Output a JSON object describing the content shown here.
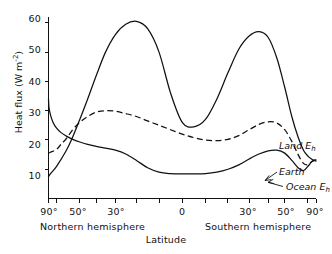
{
  "chart_data": {
    "type": "line",
    "title": "",
    "xlabel": "Latitude",
    "ylabel": "Heat flux (W m-2)",
    "ylabel_main": "Heat flux (W m",
    "ylabel_exp": "-2",
    "ylabel_close": ")",
    "xlim_note": "sine-latitude scale, 90 deg N (left) to 90 deg S (right)",
    "ylim": [
      0,
      62
    ],
    "grid": false,
    "legend_position": "inline-annotations-right",
    "yticks": [
      10,
      20,
      30,
      40,
      50,
      60
    ],
    "ytick_labels": [
      "10",
      "20",
      "30",
      "40",
      "50",
      "60"
    ],
    "xticks_deg": [
      90,
      70,
      50,
      40,
      30,
      20,
      10,
      0,
      -10,
      -20,
      -30,
      -40,
      -50,
      -70,
      -90
    ],
    "xtick_labels": [
      {
        "text": "90°",
        "deg": 90
      },
      {
        "text": "50°",
        "deg": 50
      },
      {
        "text": "30°",
        "deg": 30
      },
      {
        "text": "0",
        "deg": 0
      },
      {
        "text": "30°",
        "deg": -30
      },
      {
        "text": "50°",
        "deg": -50
      },
      {
        "text": "90°",
        "deg": -90
      }
    ],
    "hemisphere_labels": [
      {
        "text": "Northern hemisphere",
        "side": "north"
      },
      {
        "text": "Southern hemisphere",
        "side": "south"
      }
    ],
    "series": [
      {
        "name": "Land Eh",
        "label_main": "Land E",
        "label_sub": "h",
        "style": "solid",
        "x_deg": [
          90,
          80,
          70,
          60,
          55,
          50,
          45,
          40,
          35,
          30,
          25,
          20,
          15,
          10,
          5,
          0,
          -5,
          -10,
          -15,
          -20,
          -25,
          -30,
          -35,
          -40,
          -45,
          -50,
          -55,
          -60,
          -65,
          -70,
          -75,
          -80,
          -90
        ],
        "values": [
          7.5,
          8.5,
          11,
          16.5,
          21,
          27,
          34,
          42,
          50,
          56,
          59.5,
          60.5,
          58,
          50,
          36,
          26,
          24.5,
          27,
          34,
          43,
          51,
          55.5,
          57,
          55,
          48,
          38,
          28,
          21,
          16.5,
          14.5,
          13.5,
          13,
          12.8
        ]
      },
      {
        "name": "Earth",
        "label_main": "Earth",
        "label_sub": "",
        "style": "dashed",
        "x_deg": [
          90,
          80,
          70,
          65,
          60,
          55,
          50,
          45,
          40,
          35,
          30,
          25,
          20,
          15,
          10,
          5,
          0,
          -5,
          -10,
          -15,
          -20,
          -25,
          -30,
          -35,
          -40,
          -45,
          -50,
          -55,
          -60,
          -65,
          -70,
          -75,
          -80,
          -90
        ],
        "values": [
          15.5,
          15.8,
          16.8,
          18.5,
          20.5,
          23.5,
          26,
          28,
          29.5,
          30,
          29.8,
          29,
          28,
          26.5,
          25,
          23.5,
          22,
          20.8,
          20,
          19.8,
          20.2,
          21.5,
          23.5,
          25.3,
          26.2,
          25.8,
          23.5,
          19.5,
          15,
          12,
          11.5,
          12.5,
          13,
          13.2
        ]
      },
      {
        "name": "Ocean Eh",
        "label_main": "Ocean E",
        "label_sub": "h",
        "style": "solid",
        "x_deg": [
          90,
          85,
          80,
          75,
          70,
          65,
          60,
          55,
          50,
          45,
          40,
          35,
          30,
          25,
          20,
          15,
          10,
          5,
          0,
          -5,
          -10,
          -15,
          -20,
          -25,
          -30,
          -35,
          -40,
          -45,
          -50,
          -55,
          -60,
          -65,
          -70,
          -75,
          -80,
          -90
        ],
        "values": [
          34,
          31,
          28.5,
          26,
          24,
          22.5,
          21.3,
          20.2,
          19.3,
          18.5,
          17.8,
          17.2,
          16.5,
          15.2,
          13,
          10.5,
          9,
          8.5,
          8.4,
          8.4,
          8.5,
          9,
          10,
          11.5,
          13.5,
          15.2,
          16.3,
          16.5,
          15.5,
          13,
          10.5,
          9.5,
          11,
          12.5,
          13,
          13.2
        ]
      }
    ],
    "annotations": [
      {
        "text": "Land Eh",
        "placement": "right-upper"
      },
      {
        "text": "Earth",
        "placement": "right-middle"
      },
      {
        "text": "Ocean Eh",
        "placement": "right-lower"
      }
    ]
  }
}
